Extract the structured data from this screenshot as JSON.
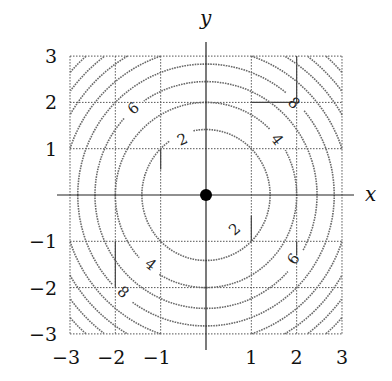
{
  "chart_data": {
    "type": "contour",
    "title": "",
    "function": "x^2 + y^2",
    "xlabel": "x",
    "ylabel": "y",
    "xlim": [
      -3,
      3
    ],
    "ylim": [
      -3,
      3
    ],
    "grid": true,
    "x_ticks": [
      -3,
      -2,
      -1,
      1,
      2,
      3
    ],
    "y_ticks": [
      3,
      2,
      1,
      -1,
      -2,
      -3
    ],
    "x_tick_labels": [
      "−3",
      "−2",
      "−1",
      "1",
      "2",
      "3"
    ],
    "y_tick_labels": [
      "3",
      "2",
      "1",
      "−1",
      "−2",
      "−3"
    ],
    "contour_levels": [
      2,
      4,
      6,
      8,
      10,
      12,
      14,
      16
    ],
    "contour_labels": [
      {
        "text": "2",
        "x": -0.52,
        "y": 1.2
      },
      {
        "text": "6",
        "x": -1.6,
        "y": 1.87
      },
      {
        "text": "4",
        "x": 1.57,
        "y": 1.2
      },
      {
        "text": "8",
        "x": 1.94,
        "y": 1.99
      },
      {
        "text": "2",
        "x": 0.63,
        "y": -0.74
      },
      {
        "text": "6",
        "x": 1.93,
        "y": -1.38
      },
      {
        "text": "4",
        "x": -1.22,
        "y": -1.5
      },
      {
        "text": "8",
        "x": -1.83,
        "y": -2.1
      }
    ],
    "marker": {
      "x": 0,
      "y": 0,
      "style": "filled-circle"
    },
    "colors": {
      "contour": "#6a6a6a",
      "grid": "#555555",
      "axis": "#222222",
      "marker": "#000000"
    }
  }
}
